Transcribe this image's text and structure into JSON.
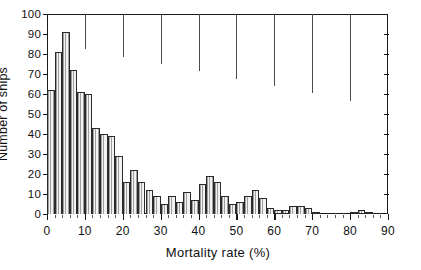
{
  "chart_data": {
    "type": "bar",
    "title": "",
    "xlabel": "Mortality rate (%)",
    "ylabel": "Number of ships",
    "xlim": [
      0,
      90
    ],
    "ylim": [
      0,
      100
    ],
    "bin_width": 2,
    "grid": false,
    "legend": null,
    "x_ticks": [
      0,
      10,
      20,
      30,
      40,
      50,
      60,
      70,
      80,
      90
    ],
    "x_tick_labels": [
      "0",
      "10",
      "20",
      "30",
      "40",
      "50",
      "60",
      "70",
      "80",
      "90"
    ],
    "x_minor_tick_step": 2,
    "y_ticks": [
      0,
      10,
      20,
      30,
      40,
      50,
      60,
      70,
      80,
      90,
      100
    ],
    "y_tick_labels": [
      "0",
      "10",
      "20",
      "30",
      "40",
      "50",
      "60",
      "70",
      "80",
      "90",
      "100"
    ],
    "top_axis_tick_step": 10,
    "bin_starts": [
      0,
      2,
      4,
      6,
      8,
      10,
      12,
      14,
      16,
      18,
      20,
      22,
      24,
      26,
      28,
      30,
      32,
      34,
      36,
      38,
      40,
      42,
      44,
      46,
      48,
      50,
      52,
      54,
      56,
      58,
      60,
      62,
      64,
      66,
      68,
      70,
      72,
      74,
      76,
      78,
      80,
      82,
      84,
      86,
      88
    ],
    "values": [
      62,
      81,
      91,
      72,
      61,
      60,
      43,
      40,
      39,
      29,
      16,
      22,
      16,
      12,
      9,
      5,
      9,
      6,
      11,
      7,
      15,
      19,
      16,
      9,
      5,
      6,
      9,
      12,
      8,
      3,
      2,
      2,
      4,
      4,
      3,
      1,
      0,
      0,
      0,
      0,
      1,
      2,
      1,
      0,
      0
    ],
    "categories": [
      "0-2",
      "2-4",
      "4-6",
      "6-8",
      "8-10",
      "10-12",
      "12-14",
      "14-16",
      "16-18",
      "18-20",
      "20-22",
      "22-24",
      "24-26",
      "26-28",
      "28-30",
      "30-32",
      "32-34",
      "34-36",
      "36-38",
      "38-40",
      "40-42",
      "42-44",
      "44-46",
      "46-48",
      "48-50",
      "50-52",
      "52-54",
      "54-56",
      "56-58",
      "58-60",
      "60-62",
      "62-64",
      "64-66",
      "66-68",
      "68-70",
      "70-72",
      "72-74",
      "74-76",
      "76-78",
      "78-80",
      "80-82",
      "82-84",
      "84-86",
      "86-88",
      "88-90"
    ]
  },
  "style": {
    "bar_edge_color": "#2a2a2a",
    "bar_fill_color": "#f2f2f2",
    "axis_color": "#1a1a1a",
    "background": "#ffffff"
  }
}
